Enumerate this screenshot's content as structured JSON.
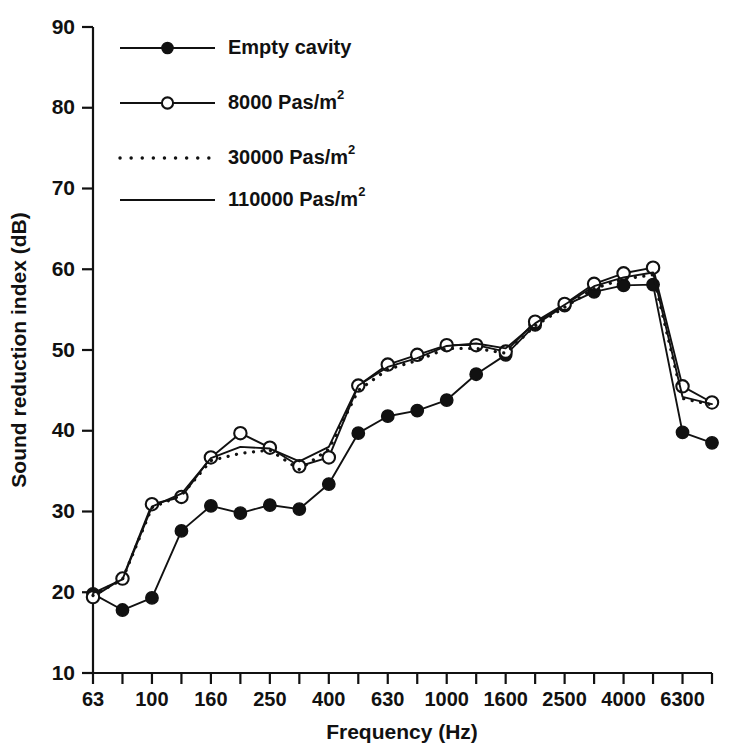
{
  "chart_data": {
    "type": "line",
    "title": "",
    "xlabel": "Frequency (Hz)",
    "ylabel": "Sound reduction index (dB)",
    "ylim": [
      10,
      90
    ],
    "ytick_values": [
      10,
      20,
      30,
      40,
      50,
      60,
      70,
      80,
      90
    ],
    "ytick_labels": [
      "10",
      "20",
      "30",
      "40",
      "50",
      "60",
      "70",
      "80",
      "90"
    ],
    "grid": false,
    "legend_position": "upper-left-inside",
    "x_scale": "third-octave-bands",
    "x": [
      63,
      80,
      100,
      125,
      160,
      200,
      250,
      315,
      400,
      500,
      630,
      800,
      1000,
      1250,
      1600,
      2000,
      2500,
      3150,
      4000,
      5000,
      6300,
      8000
    ],
    "xtick_labels_shown": [
      "63",
      "100",
      "160",
      "250",
      "400",
      "630",
      "1000",
      "1600",
      "2500",
      "4000",
      "6300"
    ],
    "xtick_label_indices": [
      0,
      2,
      4,
      6,
      8,
      10,
      12,
      14,
      16,
      18,
      20
    ],
    "series": [
      {
        "name": "Empty cavity",
        "marker": "filled-circle",
        "line": "solid",
        "values": [
          19.8,
          17.8,
          19.3,
          27.6,
          30.7,
          29.8,
          30.8,
          30.3,
          33.4,
          39.7,
          41.8,
          42.5,
          43.8,
          47.0,
          49.4,
          53.1,
          55.5,
          57.2,
          58.0,
          58.1,
          39.8,
          38.5
        ]
      },
      {
        "name": "8000 Pas/m2",
        "marker": "open-circle",
        "line": "solid",
        "values": [
          19.4,
          21.7,
          30.9,
          31.8,
          36.7,
          39.7,
          37.9,
          35.6,
          36.7,
          45.6,
          48.2,
          49.4,
          50.6,
          50.6,
          49.8,
          53.5,
          55.7,
          58.2,
          59.5,
          60.2,
          45.5,
          43.5
        ]
      },
      {
        "name": "30000 Pas/m2",
        "marker": "none",
        "line": "dotted",
        "values": [
          19.6,
          21.6,
          30.5,
          32.0,
          36.3,
          37.2,
          37.6,
          35.2,
          37.7,
          45.0,
          47.6,
          48.7,
          50.2,
          50.2,
          49.6,
          53.0,
          55.3,
          57.6,
          58.8,
          59.3,
          44.0,
          43.2
        ]
      },
      {
        "name": "110000 Pas/m2",
        "marker": "none",
        "line": "solid",
        "values": [
          19.9,
          21.6,
          30.6,
          32.2,
          36.6,
          38.0,
          37.8,
          36.2,
          38.0,
          45.6,
          47.9,
          49.0,
          50.5,
          50.8,
          50.2,
          53.3,
          55.6,
          57.9,
          59.0,
          59.6,
          44.2,
          43.3
        ]
      }
    ]
  },
  "legend": {
    "entries": [
      {
        "label": "Empty cavity",
        "sup": "",
        "style": "solid-filled-marker"
      },
      {
        "label": "8000 Pas/m",
        "sup": "2",
        "style": "solid-open-marker"
      },
      {
        "label": "30000 Pas/m",
        "sup": "2",
        "style": "dotted"
      },
      {
        "label": "110000 Pas/m",
        "sup": "2",
        "style": "solid"
      }
    ]
  },
  "colors": {
    "ink": "#111111",
    "background": "#ffffff"
  }
}
